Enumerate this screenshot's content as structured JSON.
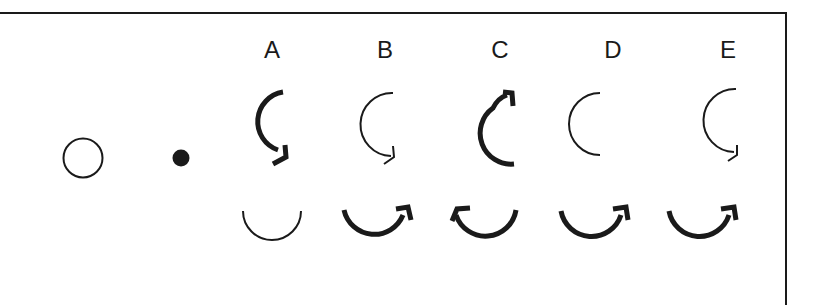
{
  "diagram": {
    "type": "visual-reasoning-puzzle",
    "given": {
      "open_circle": {
        "shape": "circle",
        "fill": "none",
        "stroke": "#1a1a1a"
      },
      "filled_dot": {
        "shape": "circle",
        "fill": "#1a1a1a"
      }
    },
    "options": [
      {
        "label": "A",
        "top_arc": {
          "weight": "thick",
          "arrow": "end-bottom",
          "direction": "counterclockwise-down"
        },
        "bottom_arc": {
          "weight": "thin",
          "arrow": "none"
        }
      },
      {
        "label": "B",
        "top_arc": {
          "weight": "thin",
          "arrow": "end-bottom",
          "direction": "counterclockwise-down"
        },
        "bottom_arc": {
          "weight": "thick",
          "arrow": "end-right",
          "direction": "counterclockwise"
        }
      },
      {
        "label": "C",
        "top_arc": {
          "weight": "thick",
          "arrow": "end-top",
          "direction": "clockwise-up"
        },
        "bottom_arc": {
          "weight": "thick",
          "arrow": "end-left",
          "direction": "clockwise"
        }
      },
      {
        "label": "D",
        "top_arc": {
          "weight": "thin",
          "arrow": "none"
        },
        "bottom_arc": {
          "weight": "thick",
          "arrow": "end-right",
          "direction": "counterclockwise"
        }
      },
      {
        "label": "E",
        "top_arc": {
          "weight": "thin",
          "arrow": "end-bottom",
          "direction": "counterclockwise-down"
        },
        "bottom_arc": {
          "weight": "thick",
          "arrow": "end-right",
          "direction": "counterclockwise"
        }
      }
    ],
    "colors": {
      "ink": "#1a1a1a",
      "background": "#ffffff"
    }
  },
  "labels": [
    "A",
    "B",
    "C",
    "D",
    "E"
  ]
}
